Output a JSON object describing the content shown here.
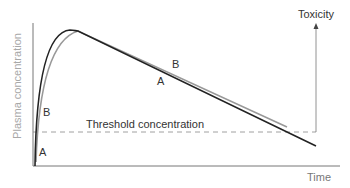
{
  "diagram": {
    "y_axis_label": "Plasma concentration",
    "x_axis_label": "Time",
    "threshold_label": "Threshold concentration",
    "toxicity_label": "Toxicity",
    "curves": [
      {
        "name": "A",
        "color": "#222222",
        "labels": [
          "A",
          "A"
        ]
      },
      {
        "name": "B",
        "color": "#999999",
        "labels": [
          "B",
          "B"
        ]
      }
    ],
    "colors": {
      "axis": "#777777",
      "threshold_line": "#888888",
      "curve_a": "#222222",
      "curve_b": "#999999"
    }
  }
}
